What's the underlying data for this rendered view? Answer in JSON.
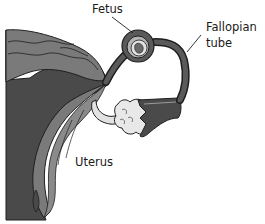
{
  "diagram": {
    "labels": {
      "fetus": "Fetus",
      "fallopian_tube_line1": "Fallopian",
      "fallopian_tube_line2": "tube",
      "uterus": "Uterus"
    },
    "colors": {
      "background": "#ffffff",
      "outline": "#1e1e1e",
      "dark_tissue": "#4a4a4a",
      "mid_tissue": "#7a7a7a",
      "light_tissue": "#b5b5b5",
      "ovary_ligament": "#e2e2e2",
      "text": "#1a1a1a"
    }
  }
}
